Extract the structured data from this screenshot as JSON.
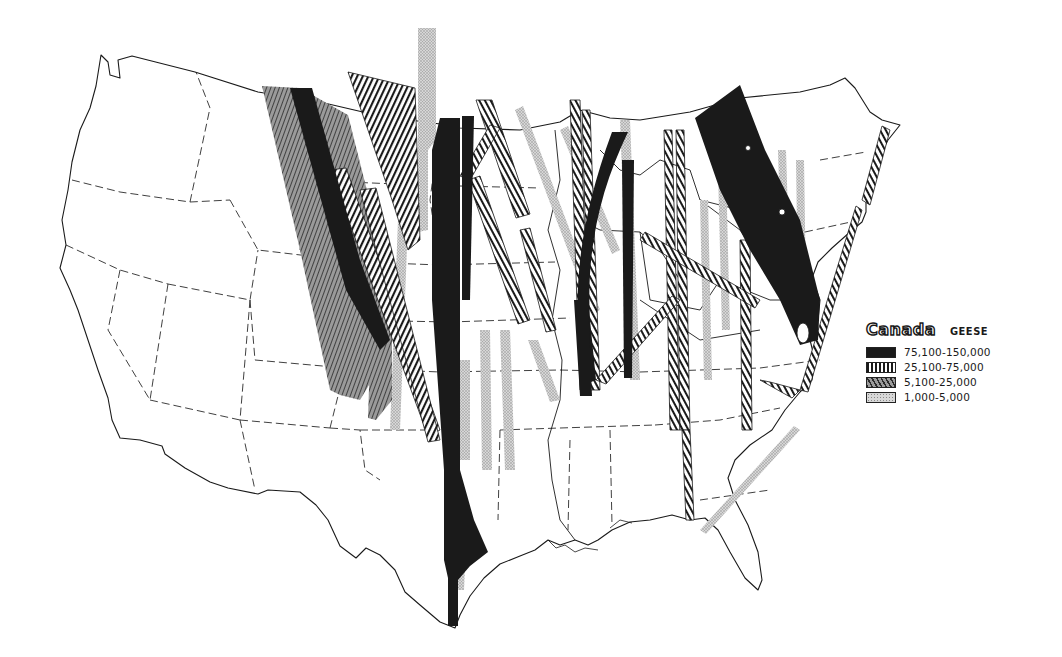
{
  "legend": {
    "title_species": "Canada",
    "title_group": "GEESE",
    "items": [
      {
        "label": "75,100-150,000",
        "pattern": "solid-black"
      },
      {
        "label": "25,100-75,000",
        "pattern": "vertical-stripes"
      },
      {
        "label": "5,100-25,000",
        "pattern": "diagonal-hatch"
      },
      {
        "label": "1,000-5,000",
        "pattern": "light-stipple"
      }
    ]
  },
  "colors": {
    "background": "#ffffff",
    "ink": "#1a1a1a",
    "stipple": "#bdbdbd",
    "hatch": "#6e6e6e"
  }
}
